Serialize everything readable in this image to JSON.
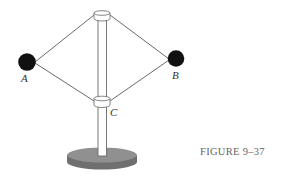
{
  "figure": {
    "caption": "FIGURE 9–37",
    "labels": {
      "a": "A",
      "b": "B",
      "c": "C"
    },
    "components": [
      "ball-A",
      "ball-B",
      "top-collar",
      "collar-C",
      "vertical-rod",
      "base",
      "four-connecting-rods"
    ],
    "colors": {
      "ball": "#111111",
      "rod_line": "#444444",
      "pole_fill": "#ffffff",
      "pole_stroke": "#666666",
      "base_top": "#8f8f8f",
      "base_side": "#6f6f6f",
      "caption": "#666666"
    }
  }
}
